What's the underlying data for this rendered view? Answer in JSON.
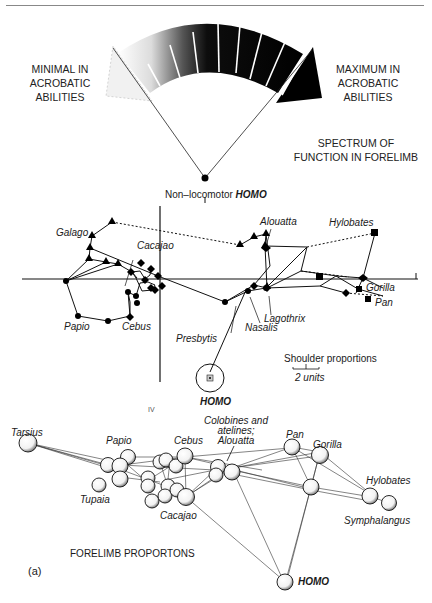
{
  "figure": {
    "panel_label": "(a)",
    "spectrum": {
      "left_caption": [
        "MINIMAL IN",
        "ACROBATIC",
        "ABILITIES"
      ],
      "right_caption": [
        "MAXIMUM IN",
        "ACROBATIC",
        "ABILITIES"
      ],
      "title": [
        "SPECTRUM OF",
        "FUNCTION IN FORELIMB"
      ],
      "pivot_label_prefix": "Non–locomotor ",
      "pivot_label_bold": "HOMO"
    },
    "shoulder_plot": {
      "scale_title": "Shoulder proportions",
      "scale_units": "2 units",
      "axis_tick_label": "IV",
      "taxa_labels": {
        "galago": "Galago",
        "cacajao": "Cacajao",
        "papio": "Papio",
        "cebus": "Cebus",
        "presbytis": "Presbytis",
        "alouatta": "Alouatta",
        "hylobates": "Hylobates",
        "gorilla": "Gorilla",
        "pan": "Pan",
        "lagothrix": "Lagothrix",
        "nasalis": "Nasalis",
        "homo": "HOMO"
      }
    },
    "forelimb_plot": {
      "title": "FORELIMB PROPORTONS",
      "taxa_labels": {
        "tarsius": "Tarsius",
        "papio": "Papio",
        "cebus": "Cebus",
        "colobines": [
          "Colobines and",
          "atelines;",
          "Alouatta"
        ],
        "pan": "Pan",
        "gorilla": "Gorilla",
        "tupaia": "Tupaia",
        "cacajao": "Cacajao",
        "hylobates": "Hylobates",
        "symphalangus": "Symphalangus",
        "homo": "HOMO"
      }
    }
  }
}
